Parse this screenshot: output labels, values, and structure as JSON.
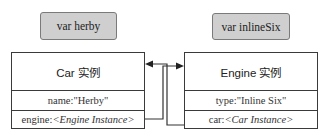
{
  "variables": [
    {
      "label": "var herby"
    },
    {
      "label": "var inlineSix"
    }
  ],
  "objects": {
    "car": {
      "title": "Car 实例",
      "fields": [
        {
          "key": "name:",
          "value": "\"Herby\"",
          "italic": false
        },
        {
          "key": "engine:",
          "value": "<Engine Instance>",
          "italic": true
        }
      ]
    },
    "engine": {
      "title": "Engine 实例",
      "fields": [
        {
          "key": "type:",
          "value": "\"Inline Six\"",
          "italic": false
        },
        {
          "key": "car: ",
          "value": "<Car Instance>",
          "italic": true
        }
      ]
    }
  },
  "links": [
    {
      "from": "car.engine",
      "to": "engine",
      "arrow": "right"
    },
    {
      "from": "engine.car",
      "to": "car",
      "arrow": "left"
    }
  ],
  "colors": {
    "label_bg": "#cfcfcf",
    "border": "#3a3a3a",
    "line": "#333333"
  }
}
